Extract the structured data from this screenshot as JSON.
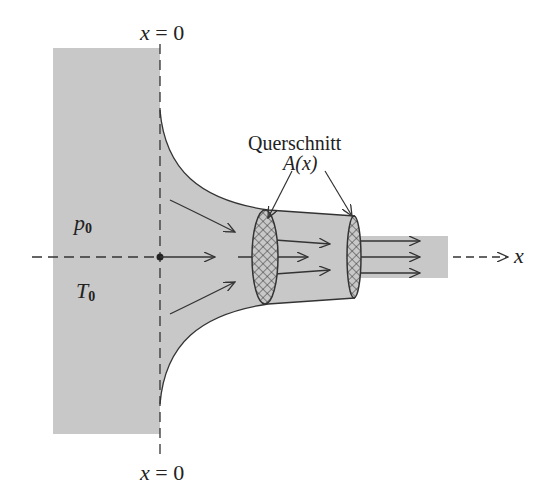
{
  "diagram": {
    "type": "nozzle-flow-schematic",
    "labels": {
      "top_axis": "x = 0",
      "bottom_axis": "x = 0",
      "cross_section_title": "Querschnitt",
      "cross_section_symbol": "A(x)",
      "pressure": "p",
      "pressure_sub": "0",
      "temperature": "T",
      "temperature_sub": "0",
      "x_axis": "x"
    },
    "colors": {
      "fill": "#c8c8c8",
      "stroke": "#333333",
      "background": "#ffffff"
    }
  }
}
